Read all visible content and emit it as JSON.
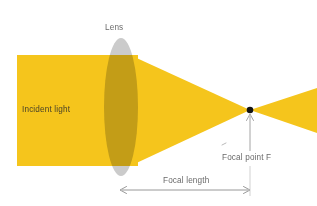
{
  "figure": {
    "title_present": false,
    "background_color": "#ffffff"
  },
  "labels": {
    "lens": "Lens",
    "incident_light": "Incident light",
    "focal_point": "Focal point F",
    "focal_length": "Focal length"
  },
  "colors": {
    "beam": "#F5C51C",
    "beam_edge": "#F2C01A",
    "lens_glass": "#C9C9C9",
    "lens_overlap": "#A89522",
    "annotation": "#6a6a6a",
    "focal_point_dot": "#111111",
    "incident_text": "#4a4328"
  },
  "geometry": {
    "incident_beam": {
      "x": 17,
      "y": 55,
      "width": 121,
      "height": 111
    },
    "lens": {
      "cx": 121,
      "cy": 107,
      "rx": 17,
      "ry": 69
    },
    "focal_point": {
      "x": 250,
      "y": 110
    },
    "converging_beam": {
      "x_start": 138,
      "y_top": 55,
      "y_bottom": 166,
      "x_end": 250
    },
    "diverging_beam": {
      "x_start": 250,
      "x_end": 317,
      "y_top_end": 88,
      "y_bottom_end": 133
    },
    "focal_length_arrow": {
      "x1": 120,
      "x2": 250,
      "y": 190
    },
    "focal_point_leader": {
      "x": 250,
      "y1": 151,
      "y2": 114
    }
  },
  "annotation_positions": {
    "lens_label": {
      "x": 105,
      "y": 29
    },
    "incident_light_label": {
      "x": 22,
      "y": 112
    },
    "focal_point_label": {
      "x": 222,
      "y": 160
    },
    "focal_length_label": {
      "x": 162,
      "y": 183
    }
  }
}
